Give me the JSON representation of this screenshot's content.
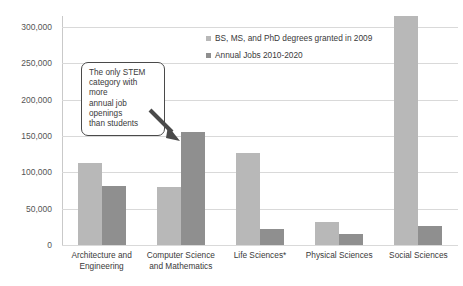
{
  "chart_data": {
    "type": "bar",
    "title": "",
    "subtitle": "",
    "xlabel": "",
    "ylabel": "",
    "ylim": [
      0,
      325000
    ],
    "ytick_values": [
      0,
      50000,
      100000,
      150000,
      200000,
      250000,
      300000
    ],
    "ytick_labels": [
      "0",
      "50,000",
      "100,000",
      "150,000",
      "200,000",
      "250,000",
      "300,000"
    ],
    "grid": true,
    "legend_position": "top-center-right",
    "categories": [
      "Architecture and Engineering",
      "Computer Science and Mathematics",
      "Life Sciences*",
      "Physical Sciences",
      "Social Sciences"
    ],
    "series": [
      {
        "name": "BS, MS, and PhD degrees granted in 2009",
        "color": "#b8b8b8",
        "values": [
          113000,
          80000,
          126000,
          32000,
          315000
        ]
      },
      {
        "name": "Annual Jobs 2010-2020",
        "color": "#8f8f8f",
        "values": [
          81000,
          155000,
          22000,
          15000,
          26000
        ]
      }
    ],
    "annotations": [
      {
        "text": "The only STEM category with more annual job openings than students",
        "lines": [
          "The only STEM",
          "category with more",
          "annual job openings",
          "than students"
        ],
        "points_to_category": "Computer Science and Mathematics",
        "points_to_series": "Annual Jobs 2010-2020"
      }
    ]
  },
  "colors": {
    "series0": "#b8b8b8",
    "series1": "#8f8f8f",
    "gridline": "#d9d9d9",
    "axis": "#c9c9c9",
    "text": "#3a3a3a",
    "callout_border": "#4a4a4a",
    "background": "#ffffff"
  }
}
